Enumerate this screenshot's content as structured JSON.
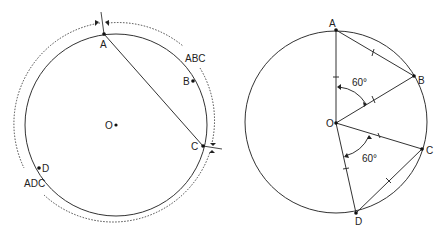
{
  "left_figure": {
    "center_label": "O",
    "points": {
      "A": "A",
      "B": "B",
      "C": "C",
      "D": "D"
    },
    "arc_labels": {
      "major": "ABC",
      "minor": "ADC"
    },
    "chord": "AC"
  },
  "right_figure": {
    "center_label": "O",
    "points": {
      "A": "A",
      "B": "B",
      "C": "C",
      "D": "D"
    },
    "angle_AOB": "60°",
    "angle_COD": "60°"
  },
  "colors": {
    "stroke": "#333333",
    "background": "#ffffff"
  }
}
